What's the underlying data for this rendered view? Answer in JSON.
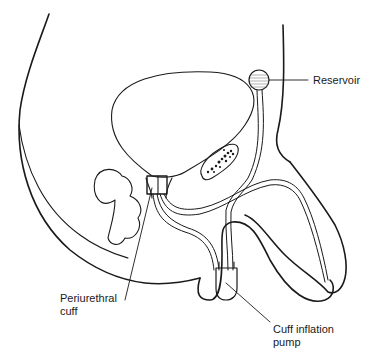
{
  "diagram": {
    "type": "anatomical-illustration",
    "labels": [
      {
        "id": "reservoir",
        "text": "Reservoir"
      },
      {
        "id": "cuff_line1",
        "text": "Periurethral"
      },
      {
        "id": "cuff_line2",
        "text": "cuff"
      },
      {
        "id": "pump_line1",
        "text": "Cuff inflation"
      },
      {
        "id": "pump_line2",
        "text": "pump"
      }
    ],
    "colors": {
      "line": "#1a1a1a",
      "background": "#ffffff"
    }
  }
}
